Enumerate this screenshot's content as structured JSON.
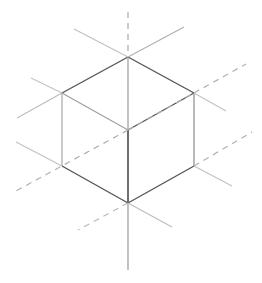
{
  "figure": {
    "width": 262,
    "height": 283,
    "background_color": "#ffffff"
  },
  "colors": {
    "edge_dark": "#555555",
    "edge_mid": "#7a7a7a",
    "edge_light": "#9e9e9e",
    "axis_solid": "#b8b8b8",
    "axis_solid_dark": "#8f8f8f",
    "axis_dashed": "#b0b0b0",
    "background": "#ffffff"
  },
  "geometry": {
    "vertices": {
      "top": [
        128,
        57
      ],
      "upper_left": [
        62,
        93
      ],
      "upper_right": [
        194,
        93
      ],
      "center": [
        128,
        130
      ],
      "lower_left": [
        62,
        166
      ],
      "lower_right": [
        194,
        166
      ],
      "bottom": [
        128,
        203
      ]
    }
  },
  "chart_data": {
    "type": "line",
    "xlabel": "",
    "ylabel": "",
    "xlim": [
      0,
      262
    ],
    "ylim": [
      0,
      283
    ],
    "grid": false,
    "legend": "none",
    "series": [
      {
        "name": "cube-top-left-edge",
        "style": "solid",
        "color": "#555555",
        "width": 1.4,
        "x": [
          128,
          62
        ],
        "y": [
          57,
          93
        ]
      },
      {
        "name": "cube-top-right-edge",
        "style": "solid",
        "color": "#555555",
        "width": 1.4,
        "x": [
          128,
          194
        ],
        "y": [
          57,
          93
        ]
      },
      {
        "name": "cube-top-face-left-inner-edge",
        "style": "solid",
        "color": "#9e9e9e",
        "width": 1.1,
        "x": [
          62,
          128
        ],
        "y": [
          93,
          130
        ]
      },
      {
        "name": "cube-top-face-right-inner-edge",
        "style": "solid",
        "color": "#555555",
        "width": 1.3,
        "x": [
          128,
          194
        ],
        "y": [
          130,
          93
        ]
      },
      {
        "name": "cube-left-vertical-edge",
        "style": "solid",
        "color": "#9e9e9e",
        "width": 1.1,
        "x": [
          62,
          62
        ],
        "y": [
          93,
          166
        ]
      },
      {
        "name": "cube-right-vertical-edge",
        "style": "solid",
        "color": "#8a8a8a",
        "width": 1.2,
        "x": [
          194,
          194
        ],
        "y": [
          93,
          166
        ]
      },
      {
        "name": "cube-center-vertical-edge",
        "style": "solid",
        "color": "#4a4a4a",
        "width": 1.6,
        "x": [
          128,
          128
        ],
        "y": [
          130,
          203
        ]
      },
      {
        "name": "cube-bottom-left-edge",
        "style": "solid",
        "color": "#555555",
        "width": 1.4,
        "x": [
          62,
          128
        ],
        "y": [
          166,
          203
        ]
      },
      {
        "name": "cube-bottom-right-edge",
        "style": "solid",
        "color": "#555555",
        "width": 1.4,
        "x": [
          128,
          194
        ],
        "y": [
          203,
          166
        ]
      },
      {
        "name": "axis-vertical-dashed-upper",
        "style": "dashed",
        "color": "#a8a8a8",
        "width": 1.2,
        "x": [
          128,
          128
        ],
        "y": [
          12,
          57
        ]
      },
      {
        "name": "axis-vertical-solid-middle",
        "style": "solid",
        "color": "#9a9a9a",
        "width": 1.2,
        "x": [
          128,
          128
        ],
        "y": [
          57,
          130
        ]
      },
      {
        "name": "axis-vertical-solid-lower",
        "style": "solid",
        "color": "#9a9a9a",
        "width": 1.2,
        "x": [
          128,
          128
        ],
        "y": [
          203,
          270
        ]
      },
      {
        "name": "axis-diagonal-dashed-upper-right",
        "style": "dashed",
        "color": "#b0b0b0",
        "width": 1.2,
        "x": [
          194,
          246
        ],
        "y": [
          93,
          64
        ]
      },
      {
        "name": "axis-diagonal-dashed-center-right",
        "style": "dashed",
        "color": "#b0b0b0",
        "width": 1.2,
        "x": [
          128,
          194
        ],
        "y": [
          130,
          93
        ]
      },
      {
        "name": "axis-diagonal-dashed-lower-left",
        "style": "dashed",
        "color": "#b0b0b0",
        "width": 1.2,
        "x": [
          128,
          14
        ],
        "y": [
          130,
          192
        ]
      },
      {
        "name": "axis-diagonal-dashed-right-lower",
        "style": "dashed",
        "color": "#b0b0b0",
        "width": 1.2,
        "x": [
          194,
          252
        ],
        "y": [
          166,
          132
        ]
      },
      {
        "name": "axis-from-top-vertex-up-left",
        "style": "solid",
        "color": "#c0c0c0",
        "width": 1.1,
        "x": [
          128,
          74
        ],
        "y": [
          57,
          29
        ]
      },
      {
        "name": "axis-from-top-vertex-up-right",
        "style": "solid",
        "color": "#b0b0b0",
        "width": 1.1,
        "x": [
          128,
          184
        ],
        "y": [
          57,
          27
        ]
      },
      {
        "name": "axis-from-upper-left-vertex-up-left",
        "style": "solid",
        "color": "#c2c2c2",
        "width": 1.1,
        "x": [
          62,
          31
        ],
        "y": [
          93,
          78
        ]
      },
      {
        "name": "axis-from-upper-left-vertex-down-left",
        "style": "solid",
        "color": "#bcbcbc",
        "width": 1.1,
        "x": [
          62,
          17
        ],
        "y": [
          93,
          118
        ]
      },
      {
        "name": "axis-from-upper-right-vertex-down-right",
        "style": "solid",
        "color": "#c2c2c2",
        "width": 1.1,
        "x": [
          194,
          226
        ],
        "y": [
          93,
          111
        ]
      },
      {
        "name": "axis-from-lower-left-vertex-up-left",
        "style": "solid",
        "color": "#c2c2c2",
        "width": 1.1,
        "x": [
          62,
          16
        ],
        "y": [
          166,
          142
        ]
      },
      {
        "name": "axis-from-lower-right-vertex-down-right",
        "style": "solid",
        "color": "#c2c2c2",
        "width": 1.1,
        "x": [
          194,
          232
        ],
        "y": [
          166,
          186
        ]
      },
      {
        "name": "axis-from-bottom-vertex-down-right",
        "style": "solid",
        "color": "#bcbcbc",
        "width": 1.1,
        "x": [
          128,
          172
        ],
        "y": [
          203,
          227
        ]
      },
      {
        "name": "axis-from-bottom-vertex-dashed-left",
        "style": "dashed",
        "color": "#b8b8b8",
        "width": 1.1,
        "x": [
          128,
          78
        ],
        "y": [
          203,
          230
        ]
      }
    ]
  }
}
